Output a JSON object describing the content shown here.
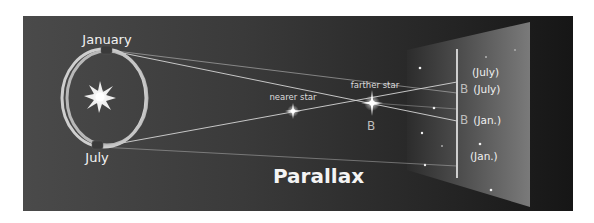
{
  "diagram": {
    "title": "Parallax",
    "orbit_labels": {
      "top": "January",
      "bottom": "July"
    },
    "star_labels": {
      "nearer": "nearer star",
      "farther": "farther star",
      "farther_mark": "B"
    },
    "background_screen": {
      "labels": [
        {
          "text": "(July)"
        },
        {
          "mark": "B",
          "text": "(July)"
        },
        {
          "mark": "B",
          "text": "(Jan.)"
        },
        {
          "text": "(Jan.)"
        }
      ]
    },
    "colors": {
      "background_dark": "#2e2e2e",
      "orbit": "#cfcfcf",
      "sight_lines": "#d8d8d8",
      "text": "#f2f2f2"
    }
  }
}
